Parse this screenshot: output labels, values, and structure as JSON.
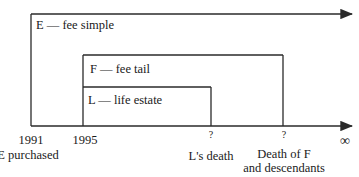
{
  "estates": [
    {
      "label": "E — fee simple",
      "holder": "E",
      "type": "fee simple"
    },
    {
      "label": "F — fee tail",
      "holder": "F",
      "type": "fee tail"
    },
    {
      "label": "L — life estate",
      "holder": "L",
      "type": "life estate"
    }
  ],
  "timeline": {
    "ticks": [
      {
        "label": "1991",
        "sublabel": "E purchased"
      },
      {
        "label": "1995",
        "sublabel": ""
      },
      {
        "label": "?",
        "sublabel": "L's death"
      },
      {
        "label": "?",
        "sublabel": "Death of F",
        "sublabel2": "and descendants"
      },
      {
        "label": "∞"
      }
    ]
  },
  "colors": {
    "line": "#2a2a2a",
    "background": "#ffffff"
  }
}
